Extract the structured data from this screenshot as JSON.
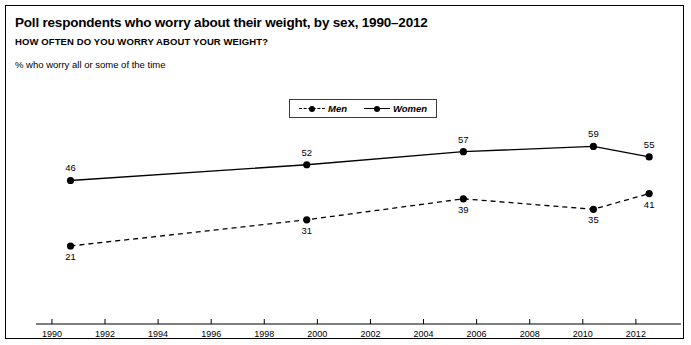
{
  "header": {
    "title": "Poll respondents who worry about their weight, by sex, 1990–2012",
    "subtitle": "HOW OFTEN DO YOU WORRY ABOUT YOUR WEIGHT?",
    "note": "% who worry all or some of the time"
  },
  "legend": {
    "items": [
      {
        "label": "Men",
        "style": "dashed",
        "marker": "dot"
      },
      {
        "label": "Women",
        "style": "solid",
        "marker": "dot"
      }
    ]
  },
  "chart_data": {
    "type": "line",
    "title": "Poll respondents who worry about their weight, by sex, 1990–2012",
    "subtitle": "HOW OFTEN DO YOU WORRY ABOUT YOUR WEIGHT?",
    "ylabel": "% who worry all or some of the time",
    "xlabel": "",
    "x": [
      1990.7,
      1999.6,
      2005.5,
      2010.4,
      2012.5
    ],
    "xlim": [
      1989.4,
      2013.7
    ],
    "ylim": [
      0,
      100
    ],
    "grid": false,
    "legend_position": "top-center",
    "xtick_labels": [
      "1990",
      "1992",
      "1994",
      "1996",
      "1998",
      "2000",
      "2002",
      "2004",
      "2006",
      "2008",
      "2010",
      "2012"
    ],
    "xticks": [
      1990,
      1992,
      1994,
      1996,
      1998,
      2000,
      2002,
      2004,
      2006,
      2008,
      2010,
      2012
    ],
    "series": [
      {
        "name": "Women",
        "style": "solid",
        "color": "#000000",
        "values": [
          46,
          52,
          57,
          59,
          55
        ],
        "label_position": [
          "above",
          "above",
          "above",
          "above",
          "above"
        ]
      },
      {
        "name": "Men",
        "style": "dashed",
        "color": "#000000",
        "values": [
          21,
          31,
          39,
          35,
          41
        ],
        "label_position": [
          "below",
          "below",
          "below",
          "below",
          "below"
        ]
      }
    ]
  }
}
